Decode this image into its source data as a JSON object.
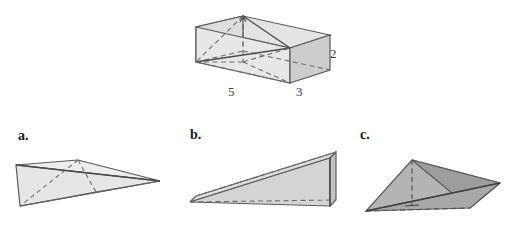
{
  "page": {
    "kind": "geometry-figure",
    "background": "#ffffff",
    "width": 514,
    "height": 233
  },
  "colors": {
    "outline": "#5a5a5a",
    "outline_dark": "#3f3f3f",
    "dashed": "#6e6e6e",
    "fill_light": "#e9e9e9",
    "fill_mid": "#d9d9d9",
    "fill_gray": "#c9c9c9",
    "fill_dark": "#a9a9a9",
    "fill_darker": "#9a9a9a",
    "text": "#1a1a1a"
  },
  "prism": {
    "name": "rectangular-box",
    "dimensions": [
      {
        "id": "length",
        "value": "5",
        "edge": "front-bottom"
      },
      {
        "id": "depth",
        "value": "3",
        "edge": "right-bottom"
      },
      {
        "id": "height",
        "value": "2",
        "edge": "right-vertical"
      }
    ],
    "solid": {
      "front_top_left": [
        196,
        27
      ],
      "front_top_right": [
        290,
        48
      ],
      "front_bot_left": [
        196,
        62
      ],
      "front_bot_right": [
        290,
        83
      ],
      "back_top_left": [
        243,
        16
      ],
      "back_top_right": [
        330,
        35
      ],
      "back_bot_left": [
        243,
        51
      ],
      "back_bot_right": [
        330,
        70
      ]
    }
  },
  "choices": [
    {
      "id": "a",
      "label": "a.",
      "shape": "flat-tetrahedron-wedge",
      "fill": "#eaeaea",
      "vertices": {
        "left_top": [
          16,
          165
        ],
        "left_bot": [
          20,
          206
        ],
        "apex_right": [
          160,
          181
        ],
        "mid_top": [
          78,
          160
        ],
        "mid_bot": [
          96,
          192
        ]
      }
    },
    {
      "id": "b",
      "label": "b.",
      "shape": "triangular-prism-wedge",
      "fill": "#d7d7d7",
      "vertices": {
        "apex_left_front": [
          190,
          202
        ],
        "apex_left_back": [
          196,
          196
        ],
        "top_right": [
          330,
          158
        ],
        "bot_right_front": [
          330,
          206
        ],
        "back_top_right": [
          336,
          152
        ],
        "back_bot_right": [
          336,
          200
        ]
      }
    },
    {
      "id": "c",
      "label": "c.",
      "shape": "pyramid",
      "fill": "#a9a9a9",
      "vertices": {
        "apex": [
          412,
          160
        ],
        "base_left": [
          366,
          211
        ],
        "base_right": [
          500,
          183
        ],
        "base_back": [
          470,
          208
        ],
        "foot": [
          412,
          205
        ]
      }
    }
  ]
}
